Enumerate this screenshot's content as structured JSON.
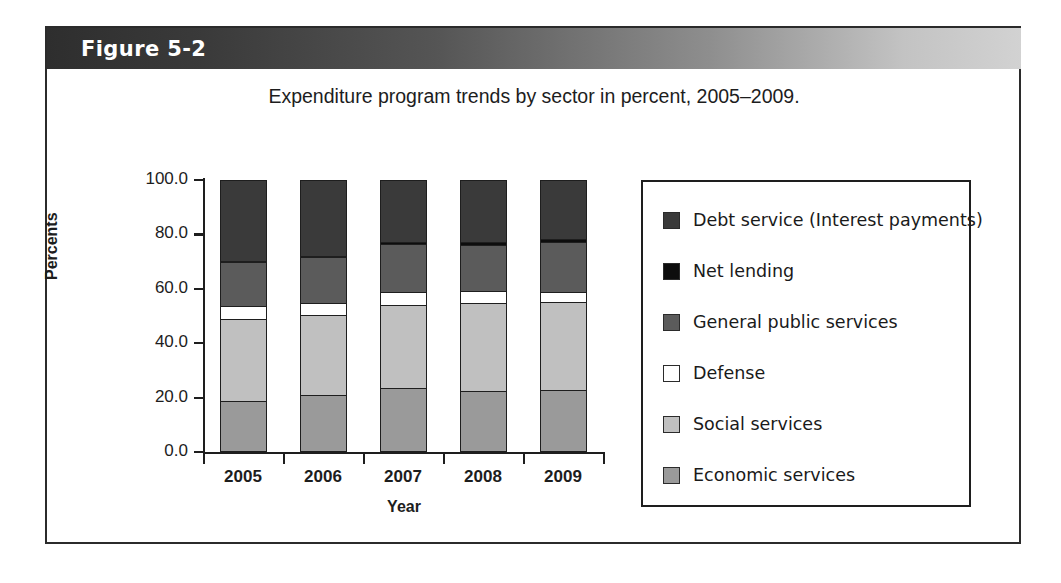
{
  "figure": {
    "header_label": "Figure 5-2",
    "frame_border_color": "#2b2b2b"
  },
  "chart_data": {
    "type": "bar",
    "stacked": true,
    "title": "Expenditure program trends by sector in percent, 2005–2009.",
    "xlabel": "Year",
    "ylabel": "Percents",
    "categories": [
      "2005",
      "2006",
      "2007",
      "2008",
      "2009"
    ],
    "ylim": [
      0.0,
      100.0
    ],
    "ytick_labels": [
      "100.0",
      "80.0",
      "60.0",
      "40.0",
      "20.0",
      "0.0"
    ],
    "ytick_values": [
      100.0,
      80.0,
      60.0,
      40.0,
      20.0,
      0.0
    ],
    "grid": false,
    "legend_position": "right",
    "series": [
      {
        "name": "Debt service (Interest payments)",
        "color": "#3a3a3a",
        "values": [
          29.7,
          27.7,
          22.6,
          22.7,
          21.5
        ]
      },
      {
        "name": "Net lending",
        "color": "#0d0d0d",
        "values": [
          0.3,
          0.4,
          0.9,
          1.1,
          1.1
        ]
      },
      {
        "name": "General public services",
        "color": "#5b5b5b",
        "values": [
          16.2,
          17.0,
          17.8,
          17.0,
          18.5
        ]
      },
      {
        "name": "Defense",
        "color": "#ffffff",
        "values": [
          4.9,
          4.4,
          4.8,
          4.4,
          3.7
        ]
      },
      {
        "name": "Social services",
        "color": "#c0c0c0",
        "values": [
          30.4,
          29.9,
          30.4,
          32.6,
          32.6
        ]
      },
      {
        "name": "Economic services",
        "color": "#9a9a9a",
        "values": [
          18.5,
          20.6,
          23.5,
          22.2,
          22.6
        ]
      }
    ]
  }
}
